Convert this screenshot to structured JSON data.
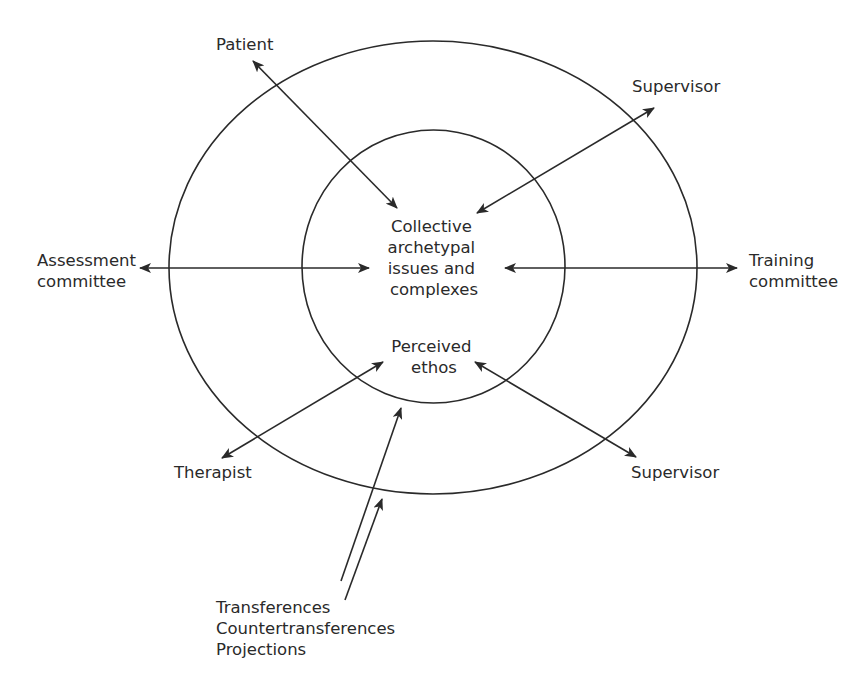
{
  "diagram": {
    "center": {
      "collective": [
        "Collective",
        "archetypal",
        "issues and",
        "complexes"
      ],
      "ethos": [
        "Perceived",
        "ethos"
      ]
    },
    "nodes": {
      "patient": [
        "Patient"
      ],
      "supervisor_top": [
        "Supervisor"
      ],
      "assessment": [
        "Assessment",
        "committee"
      ],
      "training": [
        "Training",
        "committee"
      ],
      "therapist": [
        "Therapist"
      ],
      "supervisor_bottom": [
        "Supervisor"
      ],
      "dynamics": [
        "Transferences",
        "Countertransferences",
        "Projections"
      ]
    },
    "colors": {
      "stroke": "#2a2a2a",
      "background": "#ffffff"
    }
  }
}
